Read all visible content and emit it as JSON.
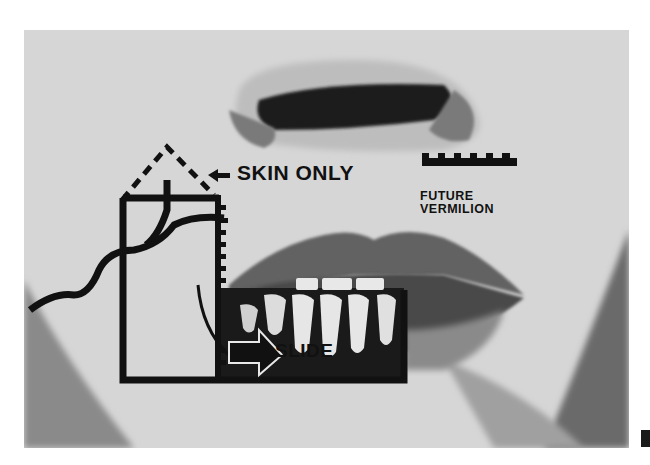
{
  "figure": {
    "annotations": {
      "skin_only": "SKIN ONLY",
      "future_vermilion_line1": "FUTURE",
      "future_vermilion_line2": "VERMILION",
      "slide": "SLIDE"
    },
    "panel_label": "",
    "colors": {
      "background": "#ffffff",
      "skin": "#d9d9d9",
      "ink": "#111111",
      "lip": "#6b6b6b"
    }
  }
}
